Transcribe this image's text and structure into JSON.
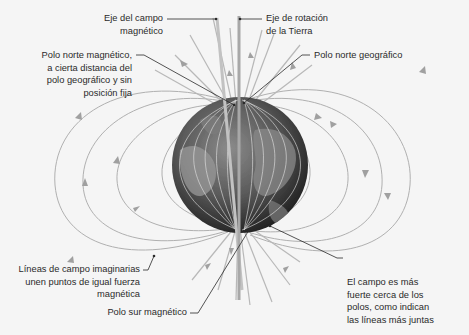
{
  "diagram": {
    "labels": {
      "magnetic_axis": {
        "line1": "Eje del campo",
        "line2": "magnético"
      },
      "rotation_axis": {
        "line1": "Eje de rotación",
        "line2": "de la Tierra"
      },
      "magnetic_north": {
        "line1": "Polo norte magnético,",
        "line2": "a cierta distancia del",
        "line3": "polo geográfico y sin",
        "line4": "posición fija"
      },
      "geographic_north": {
        "line1": "Polo norte geográfico"
      },
      "field_lines": {
        "line1": "Líneas de campo imaginarias",
        "line2": "unen puntos de igual fuerza",
        "line3": "magnética"
      },
      "magnetic_south": {
        "line1": "Polo sur magnético"
      },
      "field_strength": {
        "line1": "El campo es más",
        "line2": "fuerte cerca de los",
        "line3": "polos, como indican",
        "line4": "las líneas más juntas"
      }
    },
    "colors": {
      "background": "#f5f5f5",
      "field_line": "#a8a8a8",
      "axis": "#b5b5b5",
      "leader": "#2a2a2a",
      "globe_dark": "#2e2e2e",
      "globe_mid": "#6a6a6a",
      "globe_light": "#a0a0a0"
    }
  }
}
